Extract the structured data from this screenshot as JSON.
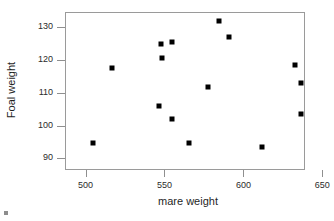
{
  "chart_data": {
    "type": "scatter",
    "title": "",
    "xlabel": "mare weight",
    "ylabel": "Foal weight",
    "xlim": [
      487,
      639
    ],
    "ylim": [
      86.5,
      134.5
    ],
    "xticks": [
      500,
      550,
      600,
      650
    ],
    "yticks": [
      90,
      100,
      110,
      120,
      130
    ],
    "xtick_labels": [
      "500",
      "550",
      "600",
      "650"
    ],
    "ytick_labels": [
      "90",
      "100",
      "110",
      "120",
      "130"
    ],
    "grid": false,
    "legend": null,
    "marker": "filled-square",
    "marker_color": "#000000",
    "points": [
      {
        "x": 504,
        "y": 95.0
      },
      {
        "x": 516,
        "y": 117.9
      },
      {
        "x": 546,
        "y": 106.3
      },
      {
        "x": 547,
        "y": 125.1
      },
      {
        "x": 548,
        "y": 120.7
      },
      {
        "x": 554,
        "y": 125.6
      },
      {
        "x": 554,
        "y": 102.2
      },
      {
        "x": 565,
        "y": 95.0
      },
      {
        "x": 577,
        "y": 111.9
      },
      {
        "x": 584,
        "y": 132.2
      },
      {
        "x": 590,
        "y": 127.2
      },
      {
        "x": 611,
        "y": 93.9
      },
      {
        "x": 632,
        "y": 118.6
      },
      {
        "x": 636,
        "y": 113.3
      },
      {
        "x": 636,
        "y": 103.9
      }
    ]
  }
}
